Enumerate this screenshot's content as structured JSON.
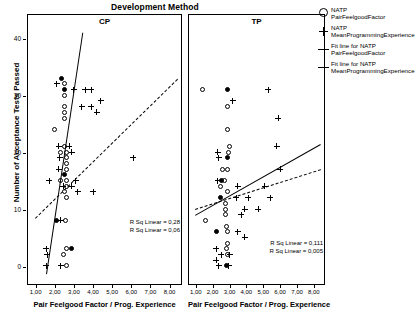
{
  "chart_data": {
    "type": "scatter",
    "title": "Development Method",
    "xlabel": "Pair Feelgood Factor / Prog. Experience",
    "ylabel": "Number of Acceptance Tests Passed",
    "xlim": [
      0.6,
      8.6
    ],
    "ylim": [
      -3,
      42
    ],
    "xticks": [
      "1,00",
      "2,00",
      "3,00",
      "4,00",
      "5,00",
      "6,00",
      "7,00",
      "8,00"
    ],
    "xtick_values": [
      1,
      2,
      3,
      4,
      5,
      6,
      7,
      8
    ],
    "yticks": [
      "0",
      "10",
      "20",
      "30",
      "40"
    ],
    "ytick_values": [
      0,
      10,
      20,
      30,
      40
    ],
    "grid": false,
    "legend_position": "right",
    "panels": [
      {
        "name": "CP",
        "series": [
          {
            "name": "NATP PairFeelgoodFactor",
            "marker": "circle",
            "points": [
              [
                2.5,
                32
              ],
              [
                2.5,
                30
              ],
              [
                2.5,
                28
              ],
              [
                2.5,
                27
              ],
              [
                2.5,
                26
              ],
              [
                2.0,
                24
              ],
              [
                2.5,
                21
              ],
              [
                2.3,
                20
              ],
              [
                2.6,
                20
              ],
              [
                2.6,
                19
              ],
              [
                2.6,
                18
              ],
              [
                2.6,
                17
              ],
              [
                2.3,
                15
              ],
              [
                2.6,
                15
              ],
              [
                2.6,
                14
              ],
              [
                2.5,
                13
              ],
              [
                2.6,
                12
              ],
              [
                2.55,
                8
              ],
              [
                2.6,
                3
              ],
              [
                2.45,
                2
              ],
              [
                2.6,
                0
              ]
            ]
          },
          {
            "name": "NATP MeanProgrammingExperience",
            "marker": "plus",
            "points": [
              [
                2.1,
                32
              ],
              [
                3.0,
                31
              ],
              [
                3.6,
                31
              ],
              [
                3.9,
                31
              ],
              [
                3.4,
                28
              ],
              [
                3.9,
                28
              ],
              [
                4.4,
                29
              ],
              [
                4.2,
                27
              ],
              [
                2.2,
                21
              ],
              [
                2.25,
                19
              ],
              [
                2.75,
                21
              ],
              [
                2.9,
                20
              ],
              [
                2.2,
                17
              ],
              [
                1.7,
                15
              ],
              [
                3.1,
                15
              ],
              [
                2.45,
                14
              ],
              [
                2.9,
                14
              ],
              [
                3.2,
                13
              ],
              [
                4.0,
                13
              ],
              [
                2.3,
                8
              ],
              [
                6.1,
                19
              ],
              [
                1.55,
                3
              ],
              [
                1.6,
                2
              ],
              [
                1.55,
                0
              ],
              [
                2.3,
                0
              ]
            ]
          },
          {
            "name": "filled-circles",
            "marker": "circle-filled",
            "points": [
              [
                2.35,
                33
              ],
              [
                2.5,
                31
              ],
              [
                2.5,
                16
              ],
              [
                2.1,
                8
              ],
              [
                2.9,
                3
              ]
            ]
          }
        ],
        "fit_lines": [
          {
            "name": "Fit line for NATP PairFeelgoodFactor",
            "style": "solid",
            "x1": 1.55,
            "y1": -1.5,
            "x2": 3.45,
            "y2": 41
          },
          {
            "name": "Fit line for NATP MeanProgrammingExperience",
            "style": "dashed",
            "x1": 0.95,
            "y1": 8.5,
            "x2": 8.4,
            "y2": 33
          }
        ],
        "rsq": [
          "R Sq Linear = 0,28",
          "R Sq Linear = 0,06"
        ]
      },
      {
        "name": "TP",
        "series": [
          {
            "name": "NATP PairFeelgoodFactor",
            "marker": "circle",
            "points": [
              [
                1.4,
                31
              ],
              [
                2.9,
                28
              ],
              [
                2.9,
                24
              ],
              [
                3.0,
                21
              ],
              [
                2.95,
                20
              ],
              [
                2.6,
                17
              ],
              [
                2.9,
                17
              ],
              [
                2.7,
                15
              ],
              [
                2.45,
                14
              ],
              [
                2.9,
                13
              ],
              [
                2.75,
                11
              ],
              [
                2.75,
                10
              ],
              [
                2.75,
                9
              ],
              [
                1.55,
                8
              ],
              [
                2.85,
                7
              ],
              [
                2.9,
                6
              ],
              [
                2.9,
                4
              ],
              [
                2.85,
                3
              ],
              [
                2.9,
                2
              ]
            ]
          },
          {
            "name": "NATP MeanProgrammingExperience",
            "marker": "plus",
            "points": [
              [
                5.3,
                31
              ],
              [
                3.2,
                29
              ],
              [
                5.9,
                26
              ],
              [
                2.3,
                20
              ],
              [
                2.35,
                19
              ],
              [
                5.8,
                21
              ],
              [
                6.0,
                17
              ],
              [
                2.3,
                15
              ],
              [
                3.5,
                14
              ],
              [
                5.1,
                14
              ],
              [
                3.4,
                12
              ],
              [
                4.1,
                12
              ],
              [
                5.4,
                12
              ],
              [
                3.9,
                10
              ],
              [
                4.7,
                10
              ],
              [
                3.7,
                9
              ],
              [
                3.5,
                6
              ],
              [
                3.9,
                5
              ],
              [
                2.2,
                3
              ],
              [
                2.5,
                2
              ],
              [
                3.0,
                2
              ],
              [
                2.2,
                1
              ],
              [
                2.35,
                0
              ],
              [
                2.95,
                0
              ]
            ]
          },
          {
            "name": "filled-circles",
            "marker": "circle-filled",
            "points": [
              [
                2.9,
                31
              ],
              [
                2.9,
                19
              ],
              [
                2.5,
                15
              ],
              [
                2.45,
                12
              ],
              [
                2.2,
                6
              ],
              [
                2.85,
                0
              ]
            ]
          }
        ],
        "fit_lines": [
          {
            "name": "Fit line for NATP PairFeelgoodFactor",
            "style": "solid",
            "x1": 0.95,
            "y1": 9.0,
            "x2": 8.4,
            "y2": 21.5
          },
          {
            "name": "Fit line for NATP MeanProgrammingExperience",
            "style": "dashed",
            "x1": 0.95,
            "y1": 10.0,
            "x2": 8.4,
            "y2": 17.0
          }
        ],
        "rsq": [
          "R Sq Linear = 0,111",
          "R Sq Linear = 0,005"
        ]
      }
    ],
    "legend": [
      {
        "symbol": "circle",
        "line1": "NATP",
        "line2": "PairFeelgoodFactor"
      },
      {
        "symbol": "plus",
        "line1": "NATP",
        "line2": "MeanProgrammingExperience"
      },
      {
        "symbol": "solid-line",
        "line1": "Fit line for NATP",
        "line2": "PairFeelgoodFactor"
      },
      {
        "symbol": "solid-line",
        "line1": "Fit line for NATP",
        "line2": "MeanProgrammingExperience"
      }
    ]
  }
}
